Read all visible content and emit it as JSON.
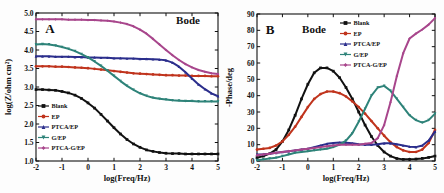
{
  "figure": {
    "panels": [
      {
        "letter": "A",
        "annotation": "Bode",
        "xlabel": "log(Freq/Hz)",
        "ylabel": "log(Z/ohm cm²)",
        "xticks": [
          "-2",
          "-1",
          "0",
          "1",
          "2",
          "3",
          "4",
          "5"
        ],
        "yticks": [
          "1.0",
          "1.5",
          "2.0",
          "2.5",
          "3.0",
          "3.5",
          "4.0",
          "4.5",
          "5.0"
        ],
        "legend": [
          "Blank",
          "EP",
          "PTCA/EP",
          "G/EP",
          "PTCA-G/EP"
        ]
      },
      {
        "letter": "B",
        "annotation": "Bode",
        "xlabel": "log(Freq/Hz)",
        "ylabel": "-Phase/deg",
        "xticks": [
          "-2",
          "-1",
          "0",
          "1",
          "2",
          "3",
          "4",
          "5"
        ],
        "yticks": [
          "0",
          "10",
          "20",
          "30",
          "40",
          "50",
          "60",
          "70",
          "80",
          "90"
        ],
        "legend": [
          "Blank",
          "EP",
          "PTCA/EP",
          "G/EP",
          "PTCA-G/EP"
        ]
      }
    ]
  },
  "colors": {
    "blank": "#111111",
    "ep": "#c0341d",
    "ptca_ep": "#2b2e8c",
    "g_ep": "#2e8379",
    "ptca_g_ep": "#a8468c"
  },
  "markers": {
    "blank": "square",
    "ep": "circle",
    "ptca_ep": "triangle-up",
    "g_ep": "triangle-down",
    "ptca_g_ep": "diamond"
  },
  "chart_data": [
    {
      "type": "line",
      "title": "Bode",
      "panel": "A",
      "xlabel": "log(Freq/Hz)",
      "ylabel": "log(Z/ohm cm2)",
      "xlim": [
        -2,
        5
      ],
      "ylim": [
        1.0,
        5.0
      ],
      "grid": false,
      "legend_position": "lower-left",
      "x": [
        -2,
        -1.75,
        -1.5,
        -1.25,
        -1,
        -0.75,
        -0.5,
        -0.25,
        0,
        0.25,
        0.5,
        0.75,
        1,
        1.25,
        1.5,
        1.75,
        2,
        2.25,
        2.5,
        2.75,
        3,
        3.25,
        3.5,
        3.75,
        4,
        4.25,
        4.5,
        4.75,
        5
      ],
      "series": [
        {
          "name": "Blank",
          "marker": "square",
          "color": "#111111",
          "values": [
            2.93,
            2.93,
            2.92,
            2.91,
            2.88,
            2.84,
            2.78,
            2.69,
            2.57,
            2.43,
            2.26,
            2.08,
            1.9,
            1.73,
            1.58,
            1.46,
            1.37,
            1.3,
            1.26,
            1.23,
            1.21,
            1.2,
            1.2,
            1.19,
            1.19,
            1.19,
            1.19,
            1.19,
            1.19
          ]
        },
        {
          "name": "EP",
          "marker": "circle",
          "color": "#c0341d",
          "values": [
            3.56,
            3.56,
            3.56,
            3.55,
            3.55,
            3.54,
            3.53,
            3.52,
            3.51,
            3.49,
            3.47,
            3.45,
            3.43,
            3.41,
            3.39,
            3.37,
            3.36,
            3.35,
            3.34,
            3.33,
            3.32,
            3.32,
            3.31,
            3.31,
            3.3,
            3.3,
            3.3,
            3.29,
            3.29
          ]
        },
        {
          "name": "PTCA/EP",
          "marker": "triangle-up",
          "color": "#2b2e8c",
          "values": [
            3.83,
            3.83,
            3.83,
            3.82,
            3.82,
            3.82,
            3.81,
            3.81,
            3.8,
            3.8,
            3.79,
            3.79,
            3.78,
            3.78,
            3.77,
            3.77,
            3.76,
            3.76,
            3.75,
            3.74,
            3.72,
            3.66,
            3.55,
            3.4,
            3.23,
            3.07,
            2.94,
            2.83,
            2.75
          ]
        },
        {
          "name": "G/EP",
          "marker": "triangle-down",
          "color": "#2e8379",
          "values": [
            4.15,
            4.16,
            4.15,
            4.12,
            4.08,
            4.03,
            3.97,
            3.89,
            3.8,
            3.69,
            3.57,
            3.44,
            3.3,
            3.16,
            3.03,
            2.92,
            2.83,
            2.76,
            2.71,
            2.68,
            2.66,
            2.64,
            2.63,
            2.62,
            2.62,
            2.61,
            2.61,
            2.61,
            2.61
          ]
        },
        {
          "name": "PTCA-G/EP",
          "marker": "diamond",
          "color": "#a8468c",
          "values": [
            4.83,
            4.83,
            4.83,
            4.83,
            4.83,
            4.82,
            4.82,
            4.82,
            4.81,
            4.81,
            4.8,
            4.79,
            4.77,
            4.74,
            4.7,
            4.64,
            4.55,
            4.44,
            4.3,
            4.15,
            4.0,
            3.86,
            3.73,
            3.62,
            3.53,
            3.46,
            3.41,
            3.37,
            3.35
          ]
        }
      ]
    },
    {
      "type": "line",
      "title": "Bode",
      "panel": "B",
      "xlabel": "log(Freq/Hz)",
      "ylabel": "-Phase/deg",
      "xlim": [
        -2,
        5
      ],
      "ylim": [
        0,
        90
      ],
      "grid": false,
      "legend_position": "upper-right",
      "x": [
        -2,
        -1.75,
        -1.5,
        -1.25,
        -1,
        -0.75,
        -0.5,
        -0.25,
        0,
        0.25,
        0.5,
        0.75,
        1,
        1.25,
        1.5,
        1.75,
        2,
        2.25,
        2.5,
        2.75,
        3,
        3.25,
        3.5,
        3.75,
        4,
        4.25,
        4.5,
        4.75,
        5
      ],
      "series": [
        {
          "name": "Blank",
          "marker": "square",
          "color": "#111111",
          "values": [
            2.0,
            3.0,
            4.5,
            7.0,
            12.0,
            19.0,
            28.0,
            38.0,
            47.0,
            54.0,
            57.0,
            57.0,
            55.0,
            51.0,
            45.0,
            38.0,
            30.0,
            22.0,
            15.0,
            9.5,
            5.5,
            3.0,
            1.5,
            1.0,
            1.0,
            1.2,
            1.6,
            2.2,
            3.0
          ]
        },
        {
          "name": "EP",
          "marker": "circle",
          "color": "#c0341d",
          "values": [
            7.0,
            7.5,
            8.0,
            9.5,
            12.0,
            16.0,
            21.0,
            27.0,
            33.0,
            38.0,
            41.0,
            42.5,
            42.5,
            41.5,
            39.5,
            36.5,
            33.0,
            29.0,
            24.5,
            20.0,
            15.5,
            11.5,
            8.5,
            6.5,
            5.5,
            5.5,
            7.0,
            11.0,
            19.0
          ]
        },
        {
          "name": "PTCA/EP",
          "marker": "triangle-up",
          "color": "#2b2e8c",
          "values": [
            4.0,
            4.2,
            4.5,
            5.0,
            5.5,
            6.0,
            6.5,
            7.0,
            7.5,
            8.5,
            9.5,
            10.5,
            11.0,
            11.3,
            11.2,
            10.8,
            10.3,
            10.0,
            10.0,
            10.3,
            10.8,
            10.8,
            10.3,
            9.5,
            8.8,
            8.5,
            9.5,
            12.5,
            18.0
          ]
        },
        {
          "name": "G/EP",
          "marker": "triangle-down",
          "color": "#2e8379",
          "values": [
            0.5,
            1.0,
            1.5,
            2.0,
            3.0,
            4.0,
            5.0,
            5.5,
            6.0,
            6.5,
            7.0,
            7.5,
            8.5,
            10.0,
            12.5,
            17.0,
            24.0,
            32.0,
            40.0,
            45.0,
            46.0,
            43.0,
            38.0,
            33.0,
            28.0,
            25.0,
            23.5,
            25.0,
            29.0
          ]
        },
        {
          "name": "PTCA-G/EP",
          "marker": "diamond",
          "color": "#a8468c",
          "values": [
            3.5,
            4.0,
            4.5,
            5.0,
            5.5,
            6.0,
            6.5,
            7.0,
            7.5,
            8.0,
            8.5,
            9.0,
            9.5,
            10.0,
            10.0,
            10.0,
            10.0,
            10.5,
            11.0,
            14.0,
            22.0,
            36.0,
            52.0,
            66.0,
            75.0,
            78.0,
            80.5,
            83.5,
            87.5
          ]
        }
      ]
    }
  ]
}
